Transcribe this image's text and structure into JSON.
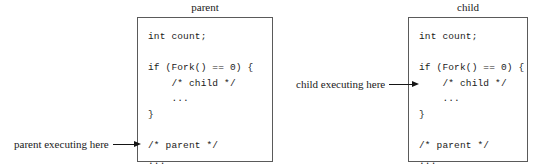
{
  "figure": {
    "type": "process-fork-diagram",
    "background_color": "#ffffff",
    "border_color": "#5a5a5a",
    "text_color": "#1a1a1a"
  },
  "boxes": [
    {
      "id": "parent",
      "title": "parent",
      "code": "int count;\n\nif (Fork() == 0) {\n    /* child */\n    ...\n}\n\n/* parent */\n..."
    },
    {
      "id": "child",
      "title": "child",
      "code": "int count;\n\nif (Fork() == 0) {\n    /* child */\n    ...\n}\n\n/* parent */\n..."
    }
  ],
  "annotations": [
    {
      "id": "parent-executing",
      "label": "parent executing here",
      "arrow": "right-arrow-icon",
      "points_to": "parent"
    },
    {
      "id": "child-executing",
      "label": "child executing here",
      "arrow": "right-arrow-icon",
      "points_to": "child"
    }
  ]
}
